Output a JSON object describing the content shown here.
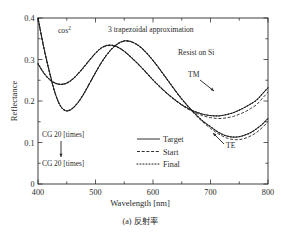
{
  "figure": {
    "caption": "(a) 反射率",
    "caption_index": "(a)",
    "caption_text": "反射率"
  },
  "annotations": {
    "cos2_base": "cos",
    "cos2_exp": "2",
    "approximation": "3 trapezoidal approximation",
    "material": "Resist on Si",
    "tm_label": "TM",
    "te_label": "TE",
    "cg_top": "CG 20  [times]",
    "cg_bottom": "CG 20  [times]"
  },
  "legend": {
    "items": [
      {
        "label": "Target",
        "style": "solid"
      },
      {
        "label": "Start",
        "style": "dashed"
      },
      {
        "label": "Final",
        "style": "dotted"
      }
    ]
  },
  "chart_data": {
    "type": "line",
    "title": "",
    "xlabel": "Wavelength  [nm]",
    "ylabel": "Reflectance",
    "xlim": [
      400,
      800
    ],
    "ylim": [
      0,
      0.4
    ],
    "xticks": [
      400,
      500,
      600,
      700,
      800
    ],
    "xtick_labels": [
      "400",
      "500",
      "600",
      "700",
      "800"
    ],
    "yticks": [
      0,
      0.1,
      0.2,
      0.3,
      0.4
    ],
    "ytick_labels": [
      "0",
      "0.1",
      "0.2",
      "0.3",
      "0.4"
    ],
    "xminor_step": 50,
    "yminor_step": 0.05,
    "grid": false,
    "legend_position": "lower-center-left",
    "x": [
      400,
      410,
      420,
      430,
      440,
      450,
      460,
      470,
      480,
      490,
      500,
      510,
      520,
      530,
      540,
      550,
      560,
      570,
      580,
      590,
      600,
      610,
      620,
      630,
      640,
      650,
      660,
      670,
      680,
      690,
      700,
      710,
      720,
      730,
      740,
      750,
      760,
      770,
      780,
      790,
      800
    ],
    "series": [
      {
        "name": "TM Target",
        "polarization": "TM",
        "variant": "Target",
        "style": "solid",
        "values": [
          0.29,
          0.268,
          0.252,
          0.243,
          0.24,
          0.243,
          0.252,
          0.266,
          0.282,
          0.299,
          0.315,
          0.328,
          0.334,
          0.334,
          0.329,
          0.32,
          0.308,
          0.295,
          0.281,
          0.266,
          0.251,
          0.237,
          0.224,
          0.212,
          0.201,
          0.191,
          0.183,
          0.176,
          0.171,
          0.167,
          0.165,
          0.164,
          0.165,
          0.168,
          0.172,
          0.178,
          0.185,
          0.193,
          0.202,
          0.217,
          0.232
        ]
      },
      {
        "name": "TM Start",
        "polarization": "TM",
        "variant": "Start",
        "style": "dashed",
        "values": [
          0.289,
          0.267,
          0.251,
          0.243,
          0.24,
          0.244,
          0.253,
          0.267,
          0.283,
          0.3,
          0.315,
          0.327,
          0.333,
          0.333,
          0.328,
          0.319,
          0.307,
          0.294,
          0.28,
          0.265,
          0.25,
          0.236,
          0.223,
          0.211,
          0.2,
          0.19,
          0.181,
          0.174,
          0.168,
          0.163,
          0.16,
          0.158,
          0.158,
          0.16,
          0.163,
          0.168,
          0.174,
          0.182,
          0.191,
          0.206,
          0.222
        ]
      },
      {
        "name": "TM Final",
        "polarization": "TM",
        "variant": "Final",
        "style": "dotted",
        "values": [
          0.29,
          0.268,
          0.252,
          0.243,
          0.24,
          0.243,
          0.252,
          0.266,
          0.282,
          0.299,
          0.315,
          0.328,
          0.334,
          0.334,
          0.329,
          0.32,
          0.308,
          0.295,
          0.281,
          0.266,
          0.251,
          0.237,
          0.224,
          0.212,
          0.201,
          0.191,
          0.183,
          0.176,
          0.171,
          0.167,
          0.165,
          0.164,
          0.165,
          0.168,
          0.172,
          0.178,
          0.185,
          0.193,
          0.202,
          0.217,
          0.232
        ]
      },
      {
        "name": "TE Target",
        "polarization": "TE",
        "variant": "Target",
        "style": "solid",
        "values": [
          0.4,
          0.33,
          0.27,
          0.218,
          0.186,
          0.176,
          0.182,
          0.197,
          0.218,
          0.243,
          0.268,
          0.292,
          0.312,
          0.328,
          0.339,
          0.345,
          0.344,
          0.338,
          0.328,
          0.314,
          0.298,
          0.28,
          0.261,
          0.242,
          0.223,
          0.205,
          0.189,
          0.174,
          0.16,
          0.148,
          0.138,
          0.128,
          0.12,
          0.115,
          0.113,
          0.114,
          0.118,
          0.124,
          0.133,
          0.144,
          0.158
        ]
      },
      {
        "name": "TE Start",
        "polarization": "TE",
        "variant": "Start",
        "style": "dashed",
        "values": [
          0.398,
          0.328,
          0.268,
          0.217,
          0.186,
          0.177,
          0.183,
          0.198,
          0.219,
          0.244,
          0.269,
          0.292,
          0.312,
          0.328,
          0.339,
          0.344,
          0.343,
          0.337,
          0.327,
          0.313,
          0.297,
          0.279,
          0.26,
          0.241,
          0.222,
          0.204,
          0.188,
          0.172,
          0.158,
          0.145,
          0.134,
          0.124,
          0.116,
          0.11,
          0.107,
          0.107,
          0.11,
          0.116,
          0.124,
          0.136,
          0.15
        ]
      },
      {
        "name": "TE Final",
        "polarization": "TE",
        "variant": "Final",
        "style": "dotted",
        "values": [
          0.4,
          0.33,
          0.27,
          0.218,
          0.186,
          0.176,
          0.182,
          0.197,
          0.218,
          0.243,
          0.268,
          0.292,
          0.312,
          0.328,
          0.339,
          0.345,
          0.344,
          0.338,
          0.328,
          0.314,
          0.298,
          0.28,
          0.261,
          0.242,
          0.223,
          0.205,
          0.189,
          0.174,
          0.16,
          0.148,
          0.138,
          0.128,
          0.12,
          0.115,
          0.113,
          0.114,
          0.118,
          0.124,
          0.133,
          0.144,
          0.158
        ]
      }
    ]
  },
  "colors": {
    "axis": "#2a2a2a",
    "curve": "#1a1a1a",
    "background": "#ffffff"
  }
}
